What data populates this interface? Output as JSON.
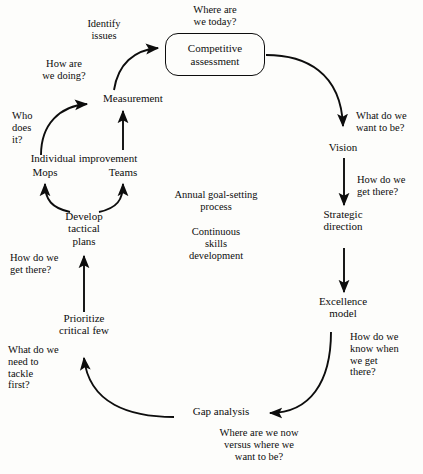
{
  "diagram": {
    "background_color": "#fdfdfb",
    "line_color": "#0d0d0d",
    "text_color": "#0d0d0d",
    "nodes": {
      "competitive_assessment": "Competitive\nassessment",
      "measurement": "Measurement",
      "individual_improvement": "Individual improvement",
      "mops": "Mops",
      "teams": "Teams",
      "develop_tactical_plans": "Develop\ntactical\nplans",
      "prioritize_critical_few": "Prioritize\ncritical few",
      "gap_analysis": "Gap analysis",
      "excellence_model": "Excellence\nmodel",
      "strategic_direction": "Strategic\ndirection",
      "vision": "Vision"
    },
    "questions": {
      "where_are_we_today": "Where are\nwe today?",
      "identify_issues": "Identify\nissues",
      "how_are_we_doing": "How are\nwe doing?",
      "who_does_it": "Who\ndoes\nit?",
      "how_do_we_get_there_left": "How do we\nget there?",
      "what_do_we_need_to_tackle_first": "What do we\nneed to\ntackle\nfirst?",
      "what_do_we_want_to_be": "What do we\nwant to be?",
      "how_do_we_get_there_right": "How do we\nget there?",
      "how_do_we_know_when_we_get_there": "How do we\nknow when\nwe get\nthere?",
      "where_are_we_now_versus": "Where are we now\nversus where we\nwant to be?"
    },
    "center_notes": {
      "annual_goal_setting": "Annual goal-setting\nprocess",
      "continuous_skills": "Continuous\nskills\ndevelopment"
    }
  }
}
